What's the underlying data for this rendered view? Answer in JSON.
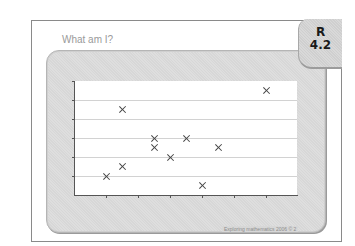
{
  "slide": {
    "title": "What am I?",
    "badge": {
      "line1": "R",
      "line2": "4.2"
    },
    "footer": "Exploring mathematics 2006 © 2"
  },
  "chart_data": {
    "type": "scatter",
    "title": "",
    "xlabel": "",
    "ylabel": "",
    "xlim": [
      0,
      7
    ],
    "ylim": [
      0,
      6
    ],
    "x_ticks": [
      1,
      2,
      3,
      4,
      5,
      6
    ],
    "y_ticks": [
      1,
      2,
      3,
      4,
      5,
      6
    ],
    "tick_labels_shown": false,
    "grid": "horizontal",
    "marker": "x",
    "points": [
      {
        "x": 1.0,
        "y": 1.0
      },
      {
        "x": 1.5,
        "y": 1.5
      },
      {
        "x": 1.5,
        "y": 4.5
      },
      {
        "x": 2.5,
        "y": 3.0
      },
      {
        "x": 2.5,
        "y": 2.5
      },
      {
        "x": 3.0,
        "y": 2.0
      },
      {
        "x": 3.5,
        "y": 3.0
      },
      {
        "x": 4.0,
        "y": 0.5
      },
      {
        "x": 4.5,
        "y": 2.5
      },
      {
        "x": 6.0,
        "y": 5.5
      }
    ]
  }
}
